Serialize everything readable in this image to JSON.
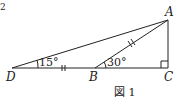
{
  "figure": {
    "caption": "図 1",
    "points": {
      "A": {
        "label": "A",
        "x": 168,
        "y": 20
      },
      "B": {
        "label": "B",
        "x": 95,
        "y": 68
      },
      "C": {
        "label": "C",
        "x": 168,
        "y": 68
      },
      "D": {
        "label": "D",
        "x": 12,
        "y": 68
      }
    },
    "angles": {
      "D": "15°",
      "B": "30°"
    },
    "marks": {
      "equal_segments": [
        "DB",
        "BA"
      ],
      "right_angle": "C"
    },
    "edge_glyph": "2"
  }
}
